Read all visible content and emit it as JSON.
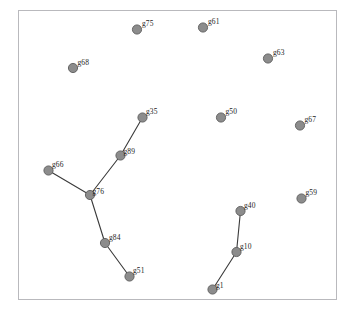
{
  "figure": {
    "type": "network-graph",
    "background_color": "#ffffff",
    "frame": {
      "x": 18,
      "y": 10,
      "width": 319,
      "height": 290,
      "border_color": "#b9b9bd",
      "border_width": 1
    },
    "node_style": {
      "fill_color": "#8c8c8c",
      "stroke_color": "#5c5c5c",
      "radius": 4.6,
      "stroke_width": 0.9
    },
    "edge_style": {
      "color": "#3a3a3a",
      "width": 1.1
    },
    "label_style": {
      "color": "#232323",
      "font_size": 7.5
    }
  },
  "graph_data": {
    "node_count": 14,
    "edge_count": 6,
    "nodes": [
      {
        "id": "g75",
        "label": "g75",
        "x": 137.0,
        "y": 29.5,
        "label_dx": 5.0,
        "label_dy": -9.5
      },
      {
        "id": "g61",
        "label": "g61",
        "x": 203.0,
        "y": 27.5,
        "label_dx": 5.0,
        "label_dy": -9.5
      },
      {
        "id": "g68",
        "label": "g68",
        "x": 73.0,
        "y": 68.0,
        "label_dx": 4.5,
        "label_dy": -9.5
      },
      {
        "id": "g63",
        "label": "g63",
        "x": 268.0,
        "y": 58.5,
        "label_dx": 5.0,
        "label_dy": -9.5
      },
      {
        "id": "g35",
        "label": "g35",
        "x": 142.5,
        "y": 117.5,
        "label_dx": 3.5,
        "label_dy": -10.0
      },
      {
        "id": "g50",
        "label": "g50",
        "x": 221.0,
        "y": 117.5,
        "label_dx": 4.5,
        "label_dy": -9.5
      },
      {
        "id": "g67",
        "label": "g67",
        "x": 300.0,
        "y": 125.5,
        "label_dx": 4.5,
        "label_dy": -9.5
      },
      {
        "id": "g89",
        "label": "g89",
        "x": 120.5,
        "y": 155.5,
        "label_dx": 3.0,
        "label_dy": -8.0
      },
      {
        "id": "g66",
        "label": "g66",
        "x": 48.5,
        "y": 170.5,
        "label_dx": 3.5,
        "label_dy": -9.5
      },
      {
        "id": "g76",
        "label": "g76",
        "x": 90.0,
        "y": 195.0,
        "label_dx": 2.5,
        "label_dy": -7.5
      },
      {
        "id": "g59",
        "label": "g59",
        "x": 301.5,
        "y": 198.5,
        "label_dx": 4.0,
        "label_dy": -9.5
      },
      {
        "id": "g40",
        "label": "g40",
        "x": 240.5,
        "y": 211.0,
        "label_dx": 3.5,
        "label_dy": -9.5
      },
      {
        "id": "g84",
        "label": "g84",
        "x": 105.0,
        "y": 243.0,
        "label_dx": 4.0,
        "label_dy": -9.0
      },
      {
        "id": "g10",
        "label": "g10",
        "x": 236.5,
        "y": 252.0,
        "label_dx": 3.5,
        "label_dy": -9.5
      },
      {
        "id": "g51",
        "label": "g51",
        "x": 129.5,
        "y": 276.5,
        "label_dx": 3.5,
        "label_dy": -9.5
      },
      {
        "id": "g1",
        "label": "g1",
        "x": 212.5,
        "y": 289.5,
        "label_dx": 3.5,
        "label_dy": -8.0
      }
    ],
    "edges": [
      {
        "source": "g35",
        "target": "g89"
      },
      {
        "source": "g89",
        "target": "g76"
      },
      {
        "source": "g66",
        "target": "g76"
      },
      {
        "source": "g76",
        "target": "g84"
      },
      {
        "source": "g84",
        "target": "g51"
      },
      {
        "source": "g40",
        "target": "g10"
      },
      {
        "source": "g10",
        "target": "g1"
      }
    ],
    "isolated_nodes": [
      "g75",
      "g61",
      "g68",
      "g63",
      "g50",
      "g67",
      "g59"
    ]
  }
}
